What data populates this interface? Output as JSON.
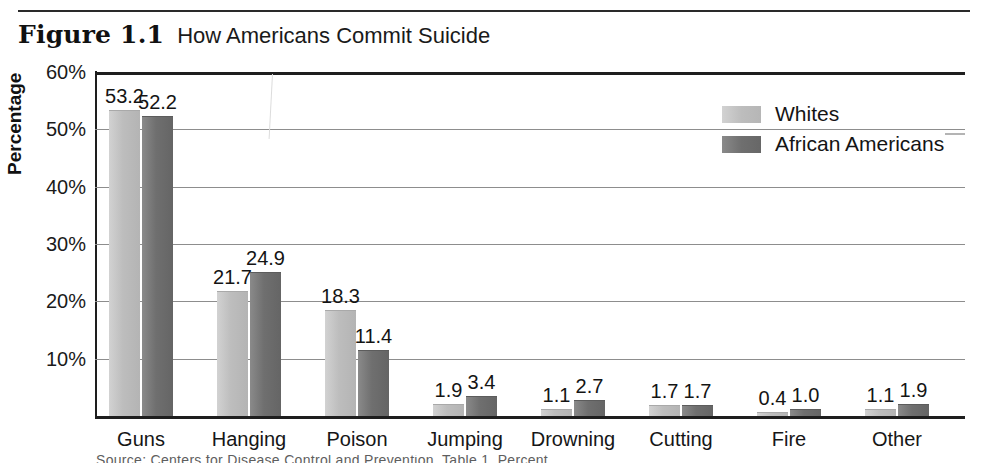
{
  "figure": {
    "number": "Figure 1.1",
    "title": "How Americans Commit Suicide"
  },
  "caption_fragment": "Source: Centers for Disease Control and Prevention, Table 1. Percent",
  "colors": {
    "whites_bar": "#bdbdbd",
    "african_americans_bar": "#6f6f6f",
    "axis_line": "#1e1e1e",
    "gridline": "#8d8d8d",
    "text": "#141414"
  },
  "legend": {
    "position": "top-right",
    "entries": [
      {
        "label": "Whites",
        "swatch": "whites"
      },
      {
        "label": "African Americans",
        "swatch": "african"
      }
    ]
  },
  "chart_data": {
    "type": "bar",
    "title": "How Americans Commit Suicide",
    "xlabel": "",
    "ylabel": "Percentage",
    "ylim": [
      0,
      60
    ],
    "ytick_labels": [
      "60%",
      "50%",
      "40%",
      "30%",
      "20%",
      "10%"
    ],
    "ytick_values": [
      60,
      50,
      40,
      30,
      20,
      10
    ],
    "grid": true,
    "legend_position": "top-right",
    "categories": [
      "Guns",
      "Hanging",
      "Poison",
      "Jumping",
      "Drowning",
      "Cutting",
      "Fire",
      "Other"
    ],
    "series": [
      {
        "name": "Whites",
        "values": [
          53.2,
          21.7,
          18.3,
          1.9,
          1.1,
          1.7,
          0.4,
          1.1
        ],
        "labels": [
          "53.2",
          "21.7",
          "18.3",
          "1.9",
          "1.1",
          "1.7",
          "0.4",
          "1.1"
        ]
      },
      {
        "name": "African Americans",
        "values": [
          52.2,
          24.9,
          11.4,
          3.4,
          2.7,
          1.7,
          1.0,
          1.9
        ],
        "labels": [
          "52.2",
          "24.9",
          "11.4",
          "3.4",
          "2.7",
          "1.7",
          "1.0",
          "1.9"
        ]
      }
    ]
  }
}
